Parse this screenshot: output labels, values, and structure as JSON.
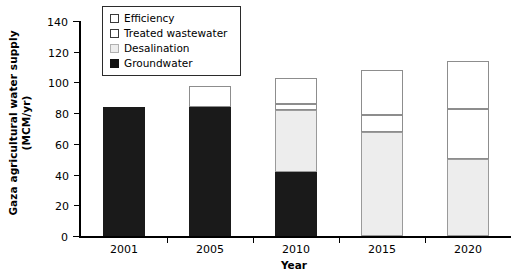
{
  "chart_data": {
    "type": "bar",
    "subtype": "stacked",
    "title": "",
    "xlabel": "Year",
    "ylabel_line1": "Gaza agricultural water supply",
    "ylabel_line2": "(MCM/yr)",
    "categories": [
      "2001",
      "2005",
      "2010",
      "2015",
      "2020"
    ],
    "ylim": [
      0,
      140
    ],
    "ytick_step": 20,
    "yticks": [
      "0",
      "20",
      "40",
      "60",
      "80",
      "100",
      "120",
      "140"
    ],
    "grid": false,
    "legend_position": "top-left-inside",
    "series": [
      {
        "name": "Groundwater",
        "color": "#1a1a1a",
        "swatch": "sw-groundwater",
        "values": [
          84,
          84,
          42,
          0,
          0
        ]
      },
      {
        "name": "Desalination",
        "color": "#ededed",
        "swatch": "sw-desalination",
        "values": [
          0,
          0,
          40,
          68,
          50
        ]
      },
      {
        "name": "Treated wastewater",
        "color": "#ffffff",
        "swatch": "sw-treated",
        "values": [
          0,
          14,
          4,
          11,
          33
        ]
      },
      {
        "name": "Efficiency",
        "color": "#ffffff",
        "swatch": "sw-efficiency",
        "values": [
          0,
          0,
          17,
          29,
          31
        ]
      }
    ],
    "totals": [
      84,
      98,
      103,
      108,
      114
    ],
    "legend_order": [
      "Efficiency",
      "Treated wastewater",
      "Desalination",
      "Groundwater"
    ]
  }
}
